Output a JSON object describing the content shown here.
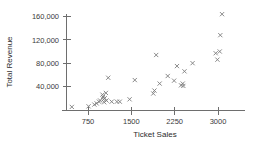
{
  "chart_data": {
    "type": "scatter",
    "title": "",
    "xlabel": "Ticket Sales",
    "ylabel": "Total Revenue",
    "xlim": [
      400,
      3200
    ],
    "ylim": [
      0,
      175000
    ],
    "xticks": [
      750,
      1500,
      2250,
      3000
    ],
    "xtick_labels": [
      "750",
      "1500",
      "2250",
      "3000"
    ],
    "yticks": [
      40000,
      80000,
      120000,
      160000
    ],
    "ytick_labels": [
      "40,000",
      "80,000",
      "120,000",
      "160,000"
    ],
    "grid": false,
    "legend": false,
    "marker": "x",
    "marker_color": "#7d7d7d",
    "axis_color": "#6e6e6e",
    "points": [
      {
        "x": 470,
        "y": 5000
      },
      {
        "x": 760,
        "y": 6000
      },
      {
        "x": 860,
        "y": 9000
      },
      {
        "x": 900,
        "y": 11000
      },
      {
        "x": 940,
        "y": 14000
      },
      {
        "x": 960,
        "y": 16000
      },
      {
        "x": 1000,
        "y": 26000
      },
      {
        "x": 1010,
        "y": 22000
      },
      {
        "x": 1020,
        "y": 18000
      },
      {
        "x": 1030,
        "y": 13000
      },
      {
        "x": 1040,
        "y": 20000
      },
      {
        "x": 1060,
        "y": 29000
      },
      {
        "x": 1070,
        "y": 16000
      },
      {
        "x": 1100,
        "y": 55000
      },
      {
        "x": 1160,
        "y": 14000
      },
      {
        "x": 1250,
        "y": 14000
      },
      {
        "x": 1300,
        "y": 14000
      },
      {
        "x": 1470,
        "y": 18000
      },
      {
        "x": 1560,
        "y": 51000
      },
      {
        "x": 1880,
        "y": 28000
      },
      {
        "x": 1900,
        "y": 33000
      },
      {
        "x": 1930,
        "y": 94000
      },
      {
        "x": 1990,
        "y": 45000
      },
      {
        "x": 2130,
        "y": 58000
      },
      {
        "x": 2240,
        "y": 50000
      },
      {
        "x": 2290,
        "y": 75000
      },
      {
        "x": 2360,
        "y": 42000
      },
      {
        "x": 2390,
        "y": 45000
      },
      {
        "x": 2400,
        "y": 41000
      },
      {
        "x": 2420,
        "y": 66000
      },
      {
        "x": 2560,
        "y": 80000
      },
      {
        "x": 2960,
        "y": 97000
      },
      {
        "x": 2990,
        "y": 86000
      },
      {
        "x": 3030,
        "y": 100000
      },
      {
        "x": 3040,
        "y": 128000
      },
      {
        "x": 3070,
        "y": 164000
      }
    ]
  }
}
